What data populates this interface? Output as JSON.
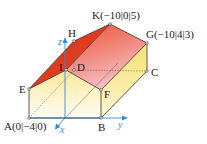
{
  "diagram": {
    "type": "3d-house-solid",
    "colors": {
      "roof_left": "#e0341c",
      "roof_right_top": "#ee5a3a",
      "roof_right_bottom": "#f4b8c0",
      "wall_top": "#fbe9a6",
      "wall_bottom": "#fffdf4",
      "side_wall": "#f7e27a",
      "edge": "#333333",
      "axis": "#2a8fd6",
      "hidden_edge": "#666666"
    },
    "points": [
      {
        "name": "A",
        "label": "A(0|−4|0)",
        "x": 29,
        "y": 118
      },
      {
        "name": "B",
        "label": "B",
        "x": 101,
        "y": 118
      },
      {
        "name": "C",
        "label": "C",
        "x": 147,
        "y": 71
      },
      {
        "name": "D",
        "label": "D",
        "x": 74,
        "y": 70
      },
      {
        "name": "E",
        "label": "E",
        "x": 29,
        "y": 89
      },
      {
        "name": "F",
        "label": "F",
        "x": 101,
        "y": 90
      },
      {
        "name": "G",
        "label": "G(−10|4|3)",
        "x": 147,
        "y": 43
      },
      {
        "name": "H",
        "label": "H",
        "x": 74,
        "y": 41
      },
      {
        "name": "I",
        "label": "I",
        "x": 66,
        "y": 70
      },
      {
        "name": "K",
        "label": "K(−10|0|5)",
        "x": 110,
        "y": 24
      }
    ],
    "axes": {
      "x": {
        "label": "x"
      },
      "y": {
        "label": "y"
      },
      "z": {
        "label": "z"
      }
    }
  }
}
